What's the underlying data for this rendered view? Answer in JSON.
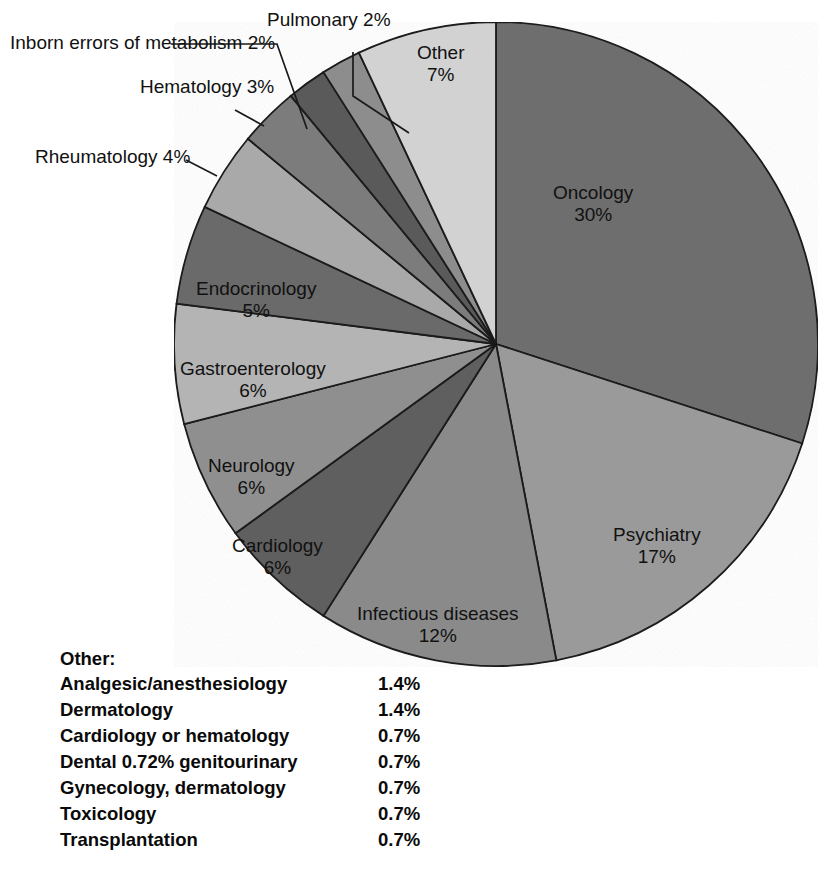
{
  "chart_data": {
    "type": "pie",
    "title": "",
    "subtitle": "",
    "xlabel": "",
    "ylabel": "",
    "units": "percent",
    "start_angle_deg": 0,
    "direction": "clockwise",
    "legend_position": "bottom-left",
    "grid": false,
    "categories": [
      "Oncology",
      "Psychiatry",
      "Infectious diseases",
      "Cardiology",
      "Neurology",
      "Gastroenterology",
      "Endocrinology",
      "Rheumatology",
      "Hematology",
      "Inborn errors of metabolism",
      "Pulmonary",
      "Other"
    ],
    "values": [
      30,
      17,
      12,
      6,
      6,
      6,
      5,
      4,
      3,
      2,
      2,
      7
    ],
    "value_labels": [
      "30%",
      "17%",
      "12%",
      "6%",
      "6%",
      "6%",
      "5%",
      "4%",
      "3%",
      "2%",
      "2%",
      "7%"
    ],
    "colors": [
      "#6e6e6e",
      "#9a9a9a",
      "#8a8a8a",
      "#5e5e5e",
      "#8f8f8f",
      "#b4b4b4",
      "#6a6a6a",
      "#a9a9a9",
      "#7b7b7b",
      "#5a5a5a",
      "#8d8d8d",
      "#d2d2d2"
    ],
    "slice_outline_color": "#1a1a1a",
    "labels_inside": [
      "Oncology",
      "Psychiatry",
      "Infectious diseases",
      "Cardiology",
      "Neurology",
      "Gastroenterology",
      "Endocrinology",
      "Other"
    ],
    "labels_with_leader_lines": [
      "Rheumatology",
      "Hematology",
      "Inborn errors of metabolism",
      "Pulmonary"
    ]
  },
  "slices": [
    {
      "name": "Oncology",
      "pct": "30%",
      "label": "Oncology"
    },
    {
      "name": "Psychiatry",
      "pct": "17%",
      "label": "Psychiatry"
    },
    {
      "name": "Infectious diseases",
      "pct": "12%",
      "label": "Infectious diseases"
    },
    {
      "name": "Cardiology",
      "pct": "6%",
      "label": "Cardiology"
    },
    {
      "name": "Neurology",
      "pct": "6%",
      "label": "Neurology"
    },
    {
      "name": "Gastroenterology",
      "pct": "6%",
      "label": "Gastroenterology"
    },
    {
      "name": "Endocrinology",
      "pct": "5%",
      "label": "Endocrinology"
    },
    {
      "name": "Rheumatology",
      "pct": "4%",
      "label": "Rheumatology"
    },
    {
      "name": "Hematology",
      "pct": "3%",
      "label": "Hematology"
    },
    {
      "name": "Inborn errors",
      "pct": "2%",
      "label_line1": "Inborn errors of",
      "label_line2": "metabolism"
    },
    {
      "name": "Pulmonary",
      "pct": "2%",
      "label": "Pulmonary"
    },
    {
      "name": "Other",
      "pct": "7%",
      "label": "Other"
    }
  ],
  "other_legend": {
    "title": "Other:",
    "rows": [
      {
        "name": "Analgesic/anesthesiology",
        "value": "1.4%"
      },
      {
        "name": "Dermatology",
        "value": "1.4%"
      },
      {
        "name": "Cardiology or hematology",
        "value": "0.7%"
      },
      {
        "name": "Dental 0.72% genitourinary",
        "value": "0.7%"
      },
      {
        "name": "Gynecology, dermatology",
        "value": "0.7%"
      },
      {
        "name": "Toxicology",
        "value": "0.7%"
      },
      {
        "name": "Transplantation",
        "value": "0.7%"
      }
    ]
  }
}
